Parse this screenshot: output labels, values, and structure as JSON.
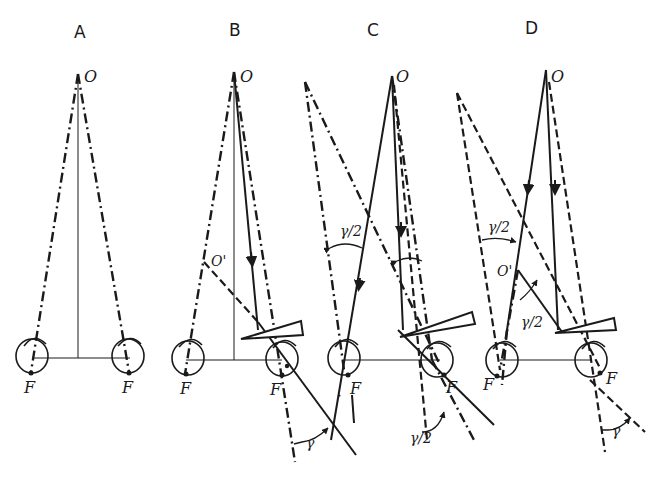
{
  "figure": {
    "type": "optics diagram: binocular fixation with prism deviation",
    "panels": [
      {
        "id": "A",
        "title": "A",
        "fixation_label": "O",
        "eye_labels": [
          "F",
          "F"
        ]
      },
      {
        "id": "B",
        "title": "B",
        "fixation_label": "O",
        "virtual_point_label": "O'",
        "eye_labels": [
          "F",
          "F"
        ],
        "angle_labels": [
          "γ"
        ]
      },
      {
        "id": "C",
        "title": "C",
        "fixation_label": "O",
        "eye_labels": [
          "F",
          "F"
        ],
        "angle_labels": [
          "γ/2",
          "γ/2"
        ]
      },
      {
        "id": "D",
        "title": "D",
        "fixation_label": "O",
        "virtual_point_label": "O'",
        "eye_labels": [
          "F",
          "F"
        ],
        "angle_labels": [
          "γ/2",
          "γ/2",
          "γ"
        ]
      }
    ],
    "legend_line_styles": {
      "solid": "light ray path",
      "dash_dot": "visual axis",
      "dashed": "visual axis (deviated)",
      "thin": "baseline / median line"
    },
    "colors": {
      "ink": "#1a1a1a",
      "background": "#ffffff"
    }
  }
}
